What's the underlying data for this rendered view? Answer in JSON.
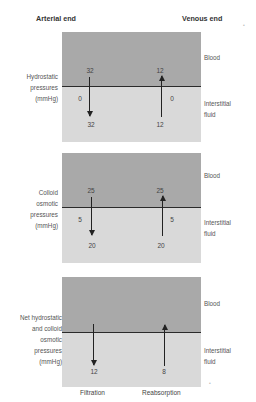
{
  "headers": {
    "arterial": "Arterial end",
    "venous": "Venous end"
  },
  "panels": [
    {
      "label_lines": [
        "Hydrostatic",
        "pressures",
        "(mmHg)"
      ],
      "blood_label": "Blood",
      "fluid_label_lines": [
        "Interstitial",
        "fluid"
      ],
      "arterial": {
        "top": "32",
        "side": "0",
        "bottom": "32",
        "direction": "down"
      },
      "venous": {
        "top": "12",
        "side": "0",
        "bottom": "12",
        "direction": "up"
      }
    },
    {
      "label_lines": [
        "Colloid",
        "osmotic",
        "pressures",
        "(mmHg)"
      ],
      "blood_label": "Blood",
      "fluid_label_lines": [
        "Interstitial",
        "fluid"
      ],
      "arterial": {
        "top": "25",
        "side": "5",
        "bottom": "20",
        "direction": "down"
      },
      "venous": {
        "top": "25",
        "side": "5",
        "bottom": "20",
        "direction": "up"
      }
    },
    {
      "label_lines": [
        "Net hydrostatic",
        "and colloid",
        "osmotic",
        "pressures",
        "(mmHg)"
      ],
      "blood_label": "Blood",
      "fluid_label_lines": [
        "Interstitial",
        "fluid"
      ],
      "arterial": {
        "bottom": "12",
        "direction": "down"
      },
      "venous": {
        "bottom": "8",
        "direction": "up"
      }
    }
  ],
  "footer": {
    "arterial": "Filtration",
    "venous": "Reabsorption"
  },
  "colors": {
    "blood": "#a9a9a9",
    "interstitial": "#d9d9d9",
    "line": "#2a2a2a"
  }
}
